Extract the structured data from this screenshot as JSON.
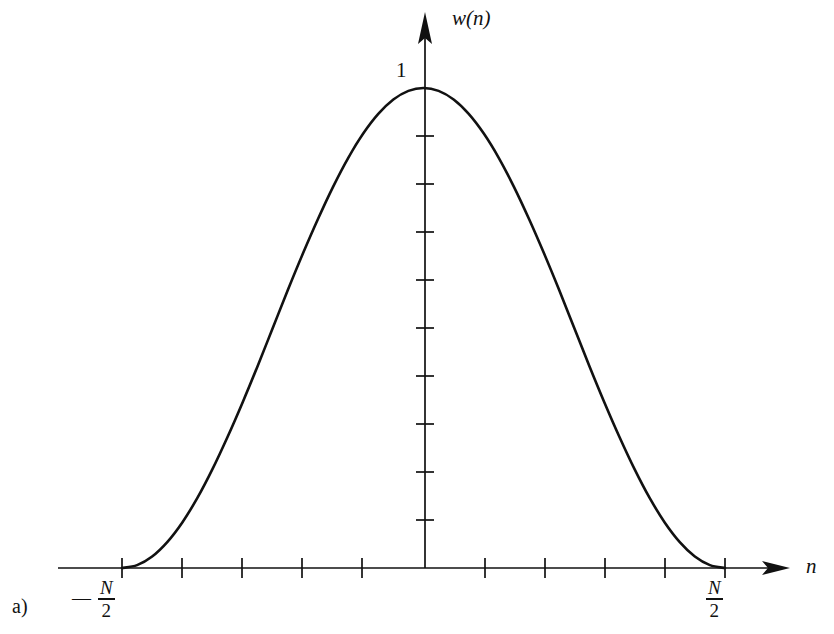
{
  "figure": {
    "panel_label": "a)",
    "background_color": "#ffffff",
    "ink_color": "#111111"
  },
  "axes": {
    "y_axis_label": "w(n)",
    "x_axis_label": "n",
    "y_tick_label_top": "1",
    "x_tick_label_left": {
      "sign": "—",
      "numerator": "N",
      "denominator": "2"
    },
    "x_tick_label_right": {
      "sign": "",
      "numerator": "N",
      "denominator": "2"
    }
  },
  "chart_data": {
    "type": "line",
    "title": "",
    "subtitle": "",
    "xlabel": "n",
    "ylabel": "w(n)",
    "xlim": [
      -0.5,
      0.5
    ],
    "ylim": [
      0,
      1.08
    ],
    "grid": false,
    "legend": null,
    "annotations": [
      "a)"
    ],
    "x_tick_labels": [
      "-N/2",
      "N/2"
    ],
    "x_tick_count": 11,
    "y_tick_labels": [
      "1"
    ],
    "y_tick_count": 9,
    "series": [
      {
        "name": "w(n)",
        "x": [
          -0.5,
          -0.475,
          -0.45,
          -0.425,
          -0.4,
          -0.375,
          -0.35,
          -0.325,
          -0.3,
          -0.275,
          -0.25,
          -0.225,
          -0.2,
          -0.175,
          -0.15,
          -0.125,
          -0.1,
          -0.075,
          -0.05,
          -0.025,
          0.0,
          0.025,
          0.05,
          0.075,
          0.1,
          0.125,
          0.15,
          0.175,
          0.2,
          0.225,
          0.25,
          0.275,
          0.3,
          0.325,
          0.35,
          0.375,
          0.4,
          0.425,
          0.45,
          0.475,
          0.5
        ],
        "values": [
          0.0,
          0.006,
          0.024,
          0.054,
          0.095,
          0.146,
          0.206,
          0.273,
          0.345,
          0.421,
          0.5,
          0.579,
          0.655,
          0.727,
          0.794,
          0.854,
          0.905,
          0.946,
          0.976,
          0.994,
          1.0,
          0.994,
          0.976,
          0.946,
          0.905,
          0.854,
          0.794,
          0.727,
          0.655,
          0.579,
          0.5,
          0.421,
          0.345,
          0.273,
          0.206,
          0.146,
          0.095,
          0.054,
          0.024,
          0.006,
          0.0
        ]
      }
    ]
  }
}
